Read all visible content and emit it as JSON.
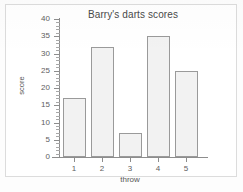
{
  "chart_data": {
    "type": "bar",
    "title": "Barry's darts scores",
    "xlabel": "throw",
    "ylabel": "score",
    "categories": [
      "1",
      "2",
      "3",
      "4",
      "5"
    ],
    "values": [
      17,
      32,
      7,
      35,
      25
    ],
    "ylim": [
      0,
      40
    ],
    "ytick_labels": [
      "0",
      "5",
      "10",
      "15",
      "20",
      "25",
      "30",
      "35",
      "40"
    ],
    "ytick_values": [
      0,
      5,
      10,
      15,
      20,
      25,
      30,
      35,
      40
    ],
    "y_minor_tick_step": 1,
    "grid": false,
    "legend": null,
    "bar_fill_color": "#f2f2f2",
    "bar_border_color": "#9a9a9a",
    "axis_color": "#8d8d8d"
  }
}
